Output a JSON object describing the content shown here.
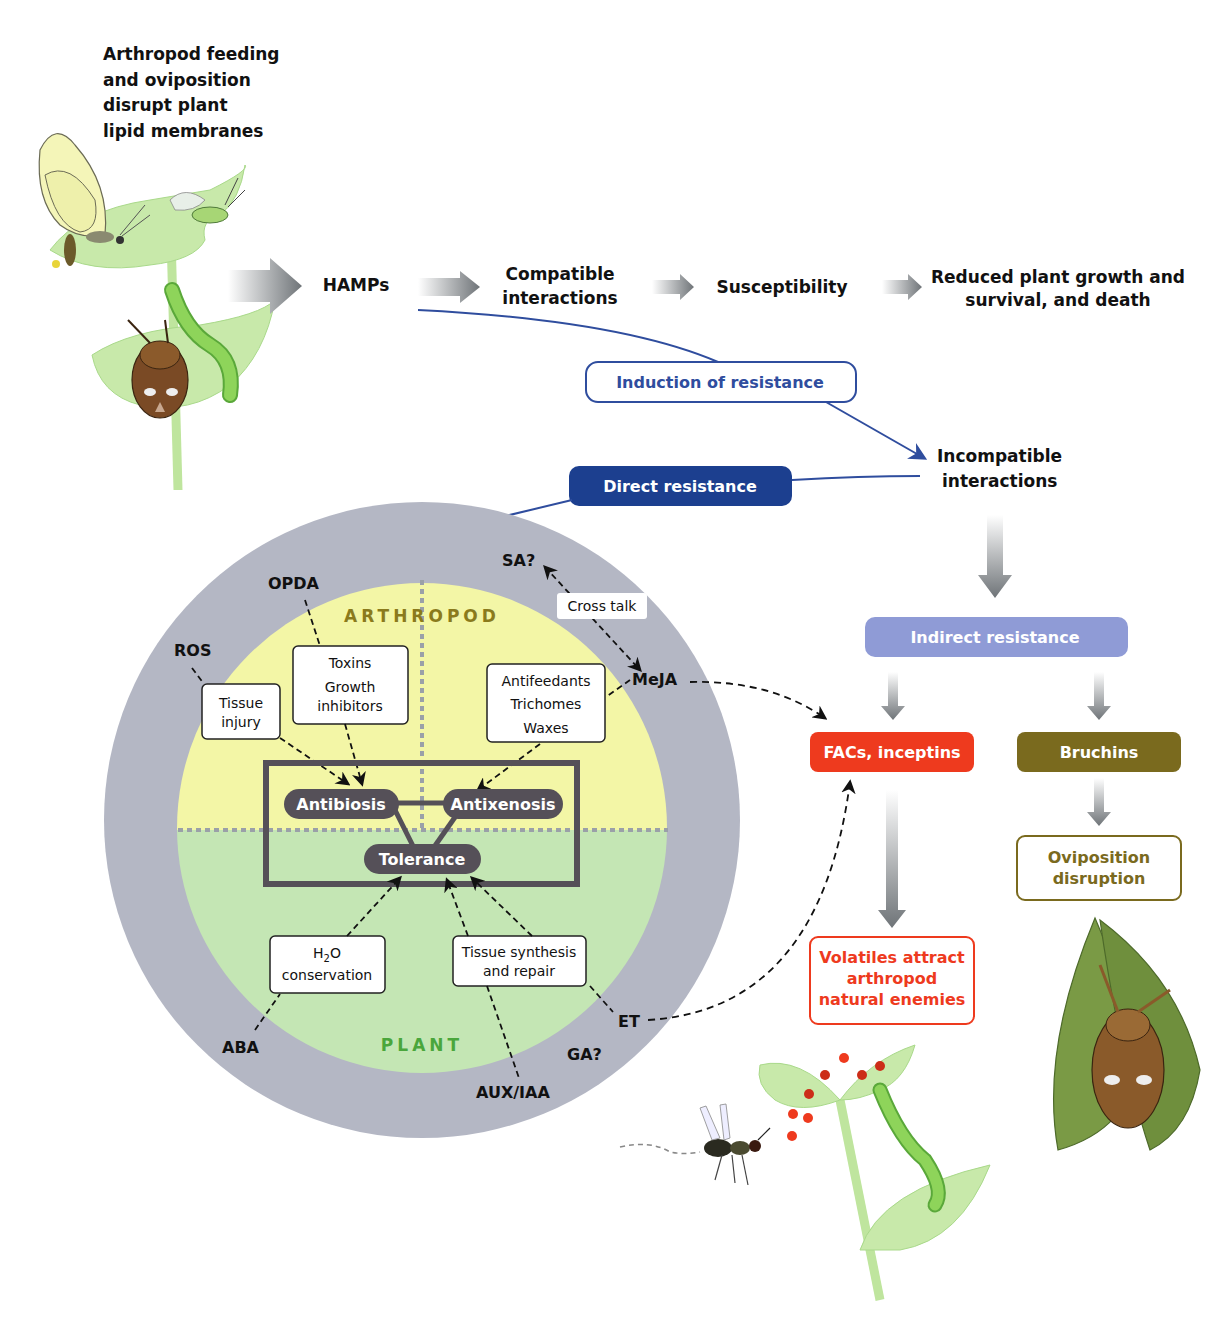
{
  "intro": {
    "lines": [
      "Arthropod feeding",
      "and oviposition",
      "disrupt plant",
      "lipid membranes"
    ]
  },
  "flow": {
    "hamps": "HAMPs",
    "compatible": [
      "Compatible",
      "interactions"
    ],
    "susceptibility": "Susceptibility",
    "reduced": [
      "Reduced plant growth and",
      "survival, and death"
    ],
    "induction": "Induction of resistance",
    "incompatible": [
      "Incompatible",
      "interactions"
    ],
    "direct": "Direct resistance",
    "indirect": "Indirect resistance",
    "facs": "FACs, inceptins",
    "bruchins": "Bruchins",
    "oviposition": [
      "Oviposition",
      "disruption"
    ],
    "volatiles": [
      "Volatiles attract",
      "arthropod",
      "natural enemies"
    ]
  },
  "circle": {
    "arthropod_label": "ARTHROPOD",
    "plant_label": "PLANT",
    "hormones": {
      "opda": "OPDA",
      "ros": "ROS",
      "sa": "SA?",
      "meja": "MeJA",
      "aba": "ABA",
      "aux": "AUX/IAA",
      "ga": "GA?",
      "et": "ET"
    },
    "cross_talk": "Cross talk",
    "boxes": {
      "tissue_injury": [
        "Tissue",
        "injury"
      ],
      "toxins": [
        "Toxins",
        "Growth",
        "inhibitors"
      ],
      "antifeedants": [
        "Antifeedants",
        "Trichomes",
        "Waxes"
      ],
      "h2o": [
        "H",
        "2",
        "O",
        "conservation"
      ],
      "tissue_synth": [
        "Tissue synthesis",
        "and repair"
      ]
    },
    "modes": {
      "antibiosis": "Antibiosis",
      "antixenosis": "Antixenosis",
      "tolerance": "Tolerance"
    }
  },
  "colors": {
    "navy": "#1c3f8f",
    "navy_line": "#3d5aa8",
    "indirect": "#8f9bd6",
    "facs_red": "#ee3a1e",
    "bruchins_olive": "#7a6a1e",
    "ring_gray": "#b4b7c4",
    "arthropod_yellow": "#f3f6a6",
    "plant_green": "#c4e6b4",
    "mode_dark": "#555058",
    "arthropod_text": "#8a7a1c",
    "plant_text": "#4aa63c",
    "leaf": "#c6e8a8"
  }
}
